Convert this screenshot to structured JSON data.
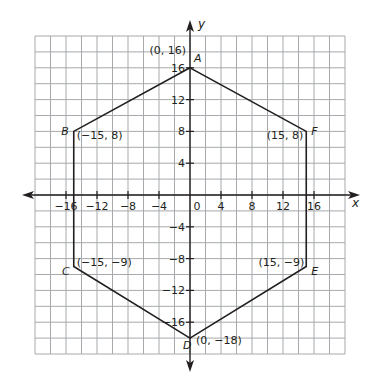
{
  "diagram": {
    "type": "coordinate-plane-polygon",
    "axes": {
      "x_label": "x",
      "y_label": "y",
      "range": {
        "xmin": -20,
        "xmax": 20,
        "ymin": -20,
        "ymax": 20
      },
      "grid_step": 2,
      "x_ticks": [
        {
          "value": -16,
          "label": "−16"
        },
        {
          "value": -12,
          "label": "−12"
        },
        {
          "value": -8,
          "label": "−8"
        },
        {
          "value": -4,
          "label": "−4"
        },
        {
          "value": 0,
          "label": "0"
        },
        {
          "value": 4,
          "label": "4"
        },
        {
          "value": 8,
          "label": "8"
        },
        {
          "value": 12,
          "label": "12"
        },
        {
          "value": 16,
          "label": "16"
        }
      ],
      "y_ticks": [
        {
          "value": 16,
          "label": "16"
        },
        {
          "value": 12,
          "label": "12"
        },
        {
          "value": 8,
          "label": "8"
        },
        {
          "value": 4,
          "label": "4"
        },
        {
          "value": -4,
          "label": "−4"
        },
        {
          "value": -8,
          "label": "−8"
        },
        {
          "value": -12,
          "label": "−12"
        },
        {
          "value": -16,
          "label": "−16"
        }
      ]
    },
    "polygon": {
      "name": "hexagon ABCDEF",
      "vertices": [
        {
          "name": "A",
          "x": 0,
          "y": 16,
          "coord_label": "(0, 16)"
        },
        {
          "name": "B",
          "x": -15,
          "y": 8,
          "coord_label": "(−15, 8)"
        },
        {
          "name": "C",
          "x": -15,
          "y": -9,
          "coord_label": "(−15, −9)"
        },
        {
          "name": "D",
          "x": 0,
          "y": -18,
          "coord_label": "(0, −18)"
        },
        {
          "name": "E",
          "x": 15,
          "y": -9,
          "coord_label": "(15, −9)"
        },
        {
          "name": "F",
          "x": 15,
          "y": 8,
          "coord_label": "(15, 8)"
        }
      ]
    },
    "colors": {
      "grid": "#a7a9ac",
      "axis": "#231f20",
      "polygon": "#231f20",
      "background": "#ffffff"
    }
  }
}
